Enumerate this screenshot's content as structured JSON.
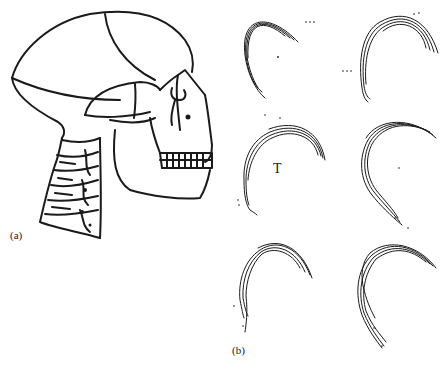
{
  "figure": {
    "panel_a": {
      "label": "(a)",
      "subject": "skull-with-cervical-vertebrae-lateral-view"
    },
    "panel_b": {
      "label": "(b)",
      "grid": {
        "rows": 3,
        "cols": 2
      },
      "tracings": [
        {
          "id": "b1",
          "annotation": ""
        },
        {
          "id": "b2",
          "annotation": ""
        },
        {
          "id": "b3",
          "annotation": "T"
        },
        {
          "id": "b4",
          "annotation": ""
        },
        {
          "id": "b5",
          "annotation": ""
        },
        {
          "id": "b6",
          "annotation": ""
        }
      ]
    },
    "colors": {
      "ink": "#1a1a1a",
      "background": "#ffffff"
    }
  }
}
